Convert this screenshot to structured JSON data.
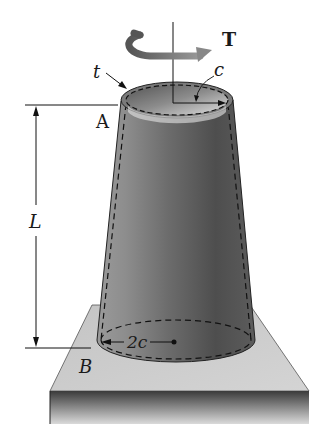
{
  "figure": {
    "labels": {
      "torque": "T",
      "thickness": "t",
      "radius_top": "c",
      "end_top": "A",
      "length": "L",
      "end_bottom": "B",
      "diameter_bottom": "2c"
    },
    "colors": {
      "background": "#ffffff",
      "shaft_dark": "#4a4a4a",
      "shaft_mid": "#8a8a8a",
      "shaft_light": "#bdbdbd",
      "inner_light": "#d9d9d9",
      "plate_top": "#c8c8c8",
      "plate_front_dark": "#3a3a3a",
      "plate_front_light": "#bfbfbf",
      "line": "#1a1a1a"
    }
  }
}
